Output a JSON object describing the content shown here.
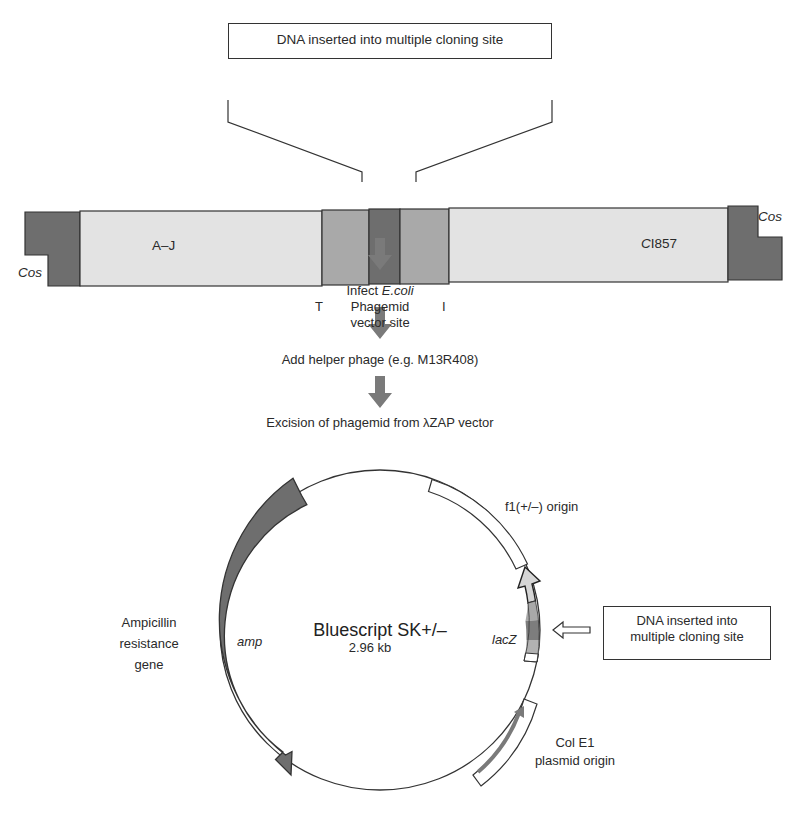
{
  "colors": {
    "dark_gray": "#6e6e6e",
    "mid_gray": "#a9a9a9",
    "light_gray": "#e3e3e3",
    "arrow_gray": "#7a7a7a",
    "line": "#333333"
  },
  "top_callout": {
    "text": "DNA inserted into multiple cloning site"
  },
  "lambda_vector": {
    "segments": [
      {
        "name": "Cos",
        "color": "dark"
      },
      {
        "name": "A–J",
        "color": "light"
      },
      {
        "name": "T",
        "color": "mid"
      },
      {
        "name": "Phagemid vector site",
        "color": "dark"
      },
      {
        "name": "I",
        "color": "mid"
      },
      {
        "name": "CI857",
        "color": "light"
      },
      {
        "name": "Cos",
        "color": "dark"
      }
    ],
    "labels": {
      "cos_left": "Cos",
      "cos_right": "Cos",
      "aj": "A–J",
      "ci857_italic": "C",
      "ci857_rest": "I857",
      "t": "T",
      "i": "I",
      "phagemid_line1": "Phagemid",
      "phagemid_line2": "vector site"
    }
  },
  "flow_steps": [
    {
      "text": "Infect ",
      "italic": "E.coli"
    },
    {
      "text": "Add helper phage (e.g. M13R408)"
    },
    {
      "text": "Excision of phagemid from λZAP vector"
    }
  ],
  "plasmid": {
    "name": "Bluescript SK+/–",
    "size": "2.96 kb",
    "features": {
      "f1": "f1(+/–) origin",
      "lacz": "lacZ",
      "amp": "amp",
      "amp_label_line1": "Ampicillin",
      "amp_label_line2": "resistance",
      "amp_label_line3": "gene",
      "cole1_line1": "Col E1",
      "cole1_line2": "plasmid origin"
    },
    "mcs_callout_line1": "DNA inserted into",
    "mcs_callout_line2": "multiple cloning site"
  }
}
